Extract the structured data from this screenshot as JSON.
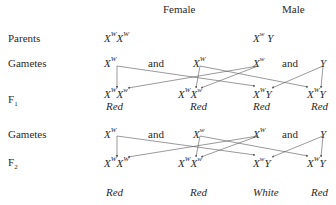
{
  "headers": {
    "female": "Female",
    "male": "Male"
  },
  "row_labels": {
    "parents": "Parents",
    "gametes1": "Gametes",
    "f1": "F",
    "f1_sub": "1",
    "gametes2": "Gametes",
    "f2": "F",
    "f2_sub": "2"
  },
  "connector": "and",
  "parents": {
    "female": {
      "a1": "X",
      "s1": "W",
      "a2": "X",
      "s2": "W"
    },
    "male": {
      "a1": "X",
      "s1": "w",
      "a2": "Y",
      "s2": ""
    }
  },
  "gametes1": [
    {
      "allele": "X",
      "sup": "W"
    },
    {
      "allele": "X",
      "sup": "W"
    },
    {
      "allele": "X",
      "sup": "w"
    },
    {
      "allele": "Y",
      "sup": ""
    }
  ],
  "f1": [
    {
      "a1": "X",
      "s1": "W",
      "a2": "X",
      "s2": "w",
      "phenotype": "Red"
    },
    {
      "a1": "X",
      "s1": "W",
      "a2": "X",
      "s2": "w",
      "phenotype": "Red"
    },
    {
      "a1": "X",
      "s1": "W",
      "a2": "Y",
      "s2": "",
      "phenotype": "Red"
    },
    {
      "a1": "X",
      "s1": "W",
      "a2": "Y",
      "s2": "",
      "phenotype": "Red"
    }
  ],
  "gametes2": [
    {
      "allele": "X",
      "sup": "W"
    },
    {
      "allele": "X",
      "sup": "w"
    },
    {
      "allele": "X",
      "sup": "W"
    },
    {
      "allele": "Y",
      "sup": ""
    }
  ],
  "f2": [
    {
      "a1": "X",
      "s1": "W",
      "a2": "X",
      "s2": "W",
      "phenotype": "Red"
    },
    {
      "a1": "X",
      "s1": "W",
      "a2": "X",
      "s2": "w",
      "phenotype": "Red"
    },
    {
      "a1": "X",
      "s1": "w",
      "a2": "Y",
      "s2": "",
      "phenotype": "White"
    },
    {
      "a1": "X",
      "s1": "W",
      "a2": "Y",
      "s2": "",
      "phenotype": "Red"
    }
  ],
  "colors": {
    "text": "#2a2a2a",
    "line": "#555555"
  }
}
